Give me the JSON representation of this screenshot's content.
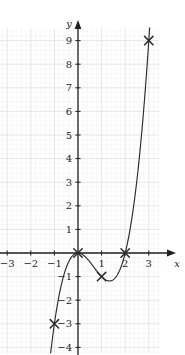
{
  "figure": {
    "background_color": "#ffffff",
    "axis_color": "#231f20",
    "curve_color": "#2b2b2b",
    "major_grid_color": "#dcdcdc",
    "minor_grid_color": "#eeeeee",
    "marker_symbol": "x",
    "x_axis_label": "x",
    "y_axis_label": "y",
    "top_partial_text": ""
  },
  "chart_data": {
    "type": "line",
    "title": "",
    "subtitle": "",
    "xlabel": "x",
    "ylabel": "y",
    "equation": "y = x³ − 2x²",
    "xlim": [
      -3.5,
      3.5
    ],
    "ylim": [
      -4.3,
      9.6
    ],
    "grid": true,
    "minor_grid": true,
    "minor_ticks_per_major": 5,
    "legend": "none",
    "x_ticks": [
      -3,
      -2,
      -1,
      1,
      2,
      3
    ],
    "x_tick_labels": [
      "−3",
      "−2",
      "−1",
      "1",
      "2",
      "3"
    ],
    "y_ticks": [
      -4,
      -3,
      -2,
      -1,
      1,
      2,
      3,
      4,
      5,
      6,
      7,
      8,
      9
    ],
    "y_tick_labels": [
      "−4",
      "−3",
      "−2",
      "−1",
      "1",
      "2",
      "3",
      "4",
      "5",
      "6",
      "7",
      "8",
      "9"
    ],
    "plotted_points": [
      {
        "x": -1,
        "y": -3,
        "label": "(−1, −3)"
      },
      {
        "x": 0,
        "y": 0,
        "label": "(0, 0)"
      },
      {
        "x": 1,
        "y": -1,
        "label": "(1, −1)"
      },
      {
        "x": 2,
        "y": 0,
        "label": "(2, 0)"
      },
      {
        "x": 3,
        "y": 9,
        "label": "(3, 9)"
      }
    ],
    "curve": {
      "name": "y = x³ − 2x²",
      "x_start": -1.17,
      "x_end": 3.05,
      "samples": 220
    }
  }
}
